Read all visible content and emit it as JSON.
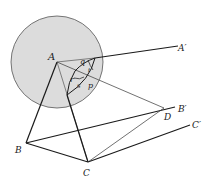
{
  "diagram": {
    "title": "",
    "colors": {
      "sphere_fill": "#dcdcdc",
      "sphere_stroke": "#555555",
      "line": "#1a1a1a",
      "thin_line": "#333333",
      "background": "#ffffff"
    },
    "points": {
      "A": {
        "label": "A",
        "x": 57,
        "y": 62
      },
      "A_prime": {
        "label": "A′",
        "x": 178,
        "y": 46
      },
      "B": {
        "label": "B",
        "x": 26,
        "y": 143
      },
      "B_prime": {
        "label": "B′",
        "x": 175,
        "y": 108
      },
      "C": {
        "label": "C",
        "x": 88,
        "y": 162
      },
      "C_prime": {
        "label": "C′",
        "x": 192,
        "y": 125
      },
      "D": {
        "label": "D",
        "x": 164,
        "y": 108
      }
    },
    "angle_labels": {
      "q": "q",
      "r": "r",
      "s": "s",
      "p": "p",
      "t": "t"
    },
    "sphere": {
      "cx": 57,
      "cy": 62,
      "r": 46
    }
  }
}
